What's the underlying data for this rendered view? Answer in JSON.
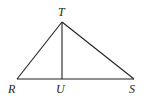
{
  "diagram": {
    "type": "triangle-with-altitude",
    "points": {
      "T": {
        "label": "T",
        "x": 62,
        "y": 22,
        "lx": 58,
        "ly": 16
      },
      "R": {
        "label": "R",
        "x": 17,
        "y": 79,
        "lx": 8,
        "ly": 93
      },
      "U": {
        "label": "U",
        "x": 62,
        "y": 79,
        "lx": 56,
        "ly": 93
      },
      "S": {
        "label": "S",
        "x": 134,
        "y": 79,
        "lx": 129,
        "ly": 93
      }
    },
    "segments": [
      [
        "R",
        "T"
      ],
      [
        "T",
        "S"
      ],
      [
        "R",
        "S"
      ],
      [
        "T",
        "U"
      ]
    ],
    "stroke_color": "#231f20"
  }
}
